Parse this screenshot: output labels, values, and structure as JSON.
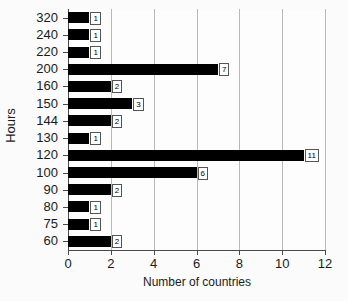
{
  "chart_data": {
    "type": "bar",
    "orientation": "horizontal",
    "title": "",
    "xlabel": "Number of countries",
    "ylabel": "Hours",
    "categories": [
      "320",
      "240",
      "220",
      "200",
      "160",
      "150",
      "144",
      "130",
      "120",
      "100",
      "90",
      "80",
      "75",
      "60"
    ],
    "values": [
      1,
      1,
      1,
      7,
      2,
      3,
      2,
      1,
      11,
      6,
      2,
      1,
      1,
      2
    ],
    "xlim": [
      0,
      12
    ],
    "xticks": [
      "0",
      "2",
      "4",
      "6",
      "8",
      "10",
      "12"
    ],
    "grid": "vertical",
    "legend": "none",
    "bar_color": "#000000",
    "data_labels": [
      "1",
      "1",
      "1",
      "7",
      "2",
      "3",
      "2",
      "1",
      "11",
      "6",
      "2",
      "1",
      "1",
      "2"
    ]
  }
}
